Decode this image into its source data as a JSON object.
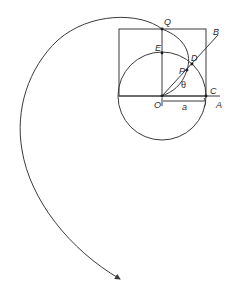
{
  "diagram": {
    "labels": {
      "Q": "Q",
      "E": "E",
      "D": "D",
      "B": "B",
      "P": "P",
      "theta": "θ",
      "O": "O",
      "C": "C",
      "A": "A",
      "a": "a"
    },
    "colors": {
      "stroke": "#3a3a3a",
      "text": "#2a2a2a",
      "background": "#ffffff"
    },
    "points": {
      "O": [
        162,
        96
      ],
      "C": [
        206,
        96
      ],
      "E": [
        162,
        53
      ],
      "Q": [
        162,
        29
      ],
      "D": [
        192,
        64
      ],
      "P": [
        187,
        70
      ],
      "B": [
        218,
        35
      ]
    }
  }
}
